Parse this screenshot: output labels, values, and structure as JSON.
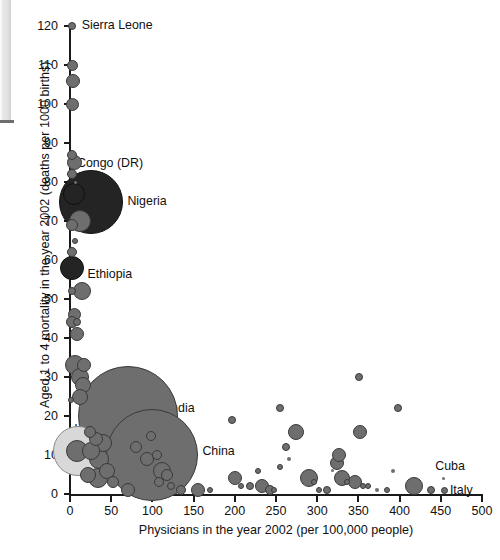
{
  "chart_data": {
    "type": "scatter",
    "title": "",
    "xlabel": "Physicians in the year 2002 (per 100,000 people)",
    "ylabel": "Aged 1 to 4 mortality in the year 2002 (deaths per 1000 births)",
    "xlim": [
      0,
      500
    ],
    "ylim": [
      0,
      120
    ],
    "xticks": [
      0,
      50,
      100,
      150,
      200,
      250,
      300,
      350,
      400,
      450,
      500
    ],
    "yticks": [
      0,
      10,
      20,
      30,
      40,
      50,
      60,
      70,
      80,
      90,
      100,
      110,
      120
    ],
    "grid": false,
    "legend": "none",
    "note": "Bubble area encodes country population; x = physicians per 100,000, y = under-5 (aged 1-4) mortality per 1000 births",
    "colors": {
      "bubble_fill": "#6e6e6e",
      "bubble_stroke": "#3a3a3a",
      "dark_bubble_fill": "#242424",
      "light_bubble_fill": "#d8d8d8",
      "axis": "#1a1a1a",
      "text": "#111111"
    },
    "annotations": [
      {
        "label": "Sierra Leone",
        "x": 2,
        "y": 120
      },
      {
        "label": "Congo (DR)",
        "x": 6,
        "y": 85
      },
      {
        "label": "Nigeria",
        "x": 26,
        "y": 75
      },
      {
        "label": "Ethiopia",
        "x": 3,
        "y": 58
      },
      {
        "label": "India",
        "x": 70,
        "y": 20
      },
      {
        "label": "Indonesia",
        "x": 10,
        "y": 11
      },
      {
        "label": "China",
        "x": 100,
        "y": 10
      },
      {
        "label": "Cuba",
        "x": 453,
        "y": 4
      },
      {
        "label": "Italy",
        "x": 455,
        "y": 1
      }
    ],
    "points": [
      {
        "x": 2,
        "y": 120,
        "r": 4,
        "t": "m"
      },
      {
        "x": 3,
        "y": 110,
        "r": 5.5,
        "t": "m"
      },
      {
        "x": 4,
        "y": 106,
        "r": 7,
        "t": "m"
      },
      {
        "x": 3,
        "y": 100,
        "r": 6.5,
        "t": "m"
      },
      {
        "x": 2,
        "y": 87,
        "r": 5,
        "t": "m"
      },
      {
        "x": 5,
        "y": 85,
        "r": 7.5,
        "t": "m"
      },
      {
        "x": 3,
        "y": 82,
        "r": 5,
        "t": "m"
      },
      {
        "x": 7,
        "y": 80,
        "r": 1.5,
        "t": "m"
      },
      {
        "x": 26,
        "y": 75,
        "r": 32,
        "t": "d"
      },
      {
        "x": 5,
        "y": 77,
        "r": 11,
        "t": "d"
      },
      {
        "x": 12,
        "y": 70,
        "r": 11,
        "t": "m"
      },
      {
        "x": 2,
        "y": 69,
        "r": 6,
        "t": "m"
      },
      {
        "x": 6,
        "y": 65,
        "r": 3,
        "t": "m"
      },
      {
        "x": 3,
        "y": 62,
        "r": 5,
        "t": "m"
      },
      {
        "x": 3,
        "y": 58,
        "r": 12,
        "t": "d"
      },
      {
        "x": 2,
        "y": 52,
        "r": 4,
        "t": "m"
      },
      {
        "x": 14,
        "y": 52,
        "r": 9,
        "t": "m"
      },
      {
        "x": 6,
        "y": 46,
        "r": 6.5,
        "t": "m"
      },
      {
        "x": 3,
        "y": 44,
        "r": 6,
        "t": "m"
      },
      {
        "x": 9,
        "y": 44,
        "r": 4,
        "t": "m"
      },
      {
        "x": 9,
        "y": 41,
        "r": 7,
        "t": "m"
      },
      {
        "x": 70,
        "y": 20,
        "r": 50,
        "t": "m"
      },
      {
        "x": 6,
        "y": 33,
        "r": 10,
        "t": "m"
      },
      {
        "x": 17,
        "y": 33,
        "r": 7,
        "t": "m"
      },
      {
        "x": 12,
        "y": 30,
        "r": 9,
        "t": "m"
      },
      {
        "x": 16,
        "y": 28,
        "r": 8,
        "t": "m"
      },
      {
        "x": 1,
        "y": 24,
        "r": 3,
        "t": "m"
      },
      {
        "x": 12,
        "y": 25,
        "r": 8,
        "t": "m"
      },
      {
        "x": 100,
        "y": 10,
        "r": 46,
        "t": "m"
      },
      {
        "x": 10,
        "y": 11,
        "r": 25,
        "t": "l"
      },
      {
        "x": 9,
        "y": 11,
        "r": 11,
        "t": "m"
      },
      {
        "x": 24,
        "y": 16,
        "r": 6,
        "t": "m"
      },
      {
        "x": 31,
        "y": 14,
        "r": 7,
        "t": "m"
      },
      {
        "x": 40,
        "y": 13,
        "r": 9,
        "t": "m"
      },
      {
        "x": 26,
        "y": 11,
        "r": 9,
        "t": "m"
      },
      {
        "x": 35,
        "y": 9,
        "r": 10,
        "t": "m"
      },
      {
        "x": 45,
        "y": 6,
        "r": 8,
        "t": "m"
      },
      {
        "x": 34,
        "y": 4,
        "r": 10,
        "t": "m"
      },
      {
        "x": 22,
        "y": 5,
        "r": 8,
        "t": "m"
      },
      {
        "x": 52,
        "y": 3,
        "r": 6,
        "t": "m"
      },
      {
        "x": 70,
        "y": 1,
        "r": 7,
        "t": "m"
      },
      {
        "x": 80,
        "y": 12,
        "r": 6,
        "t": "m"
      },
      {
        "x": 98,
        "y": 15,
        "r": 5,
        "t": "m"
      },
      {
        "x": 93,
        "y": 9,
        "r": 7,
        "t": "m"
      },
      {
        "x": 105,
        "y": 10,
        "r": 5,
        "t": "m"
      },
      {
        "x": 112,
        "y": 6,
        "r": 9,
        "t": "m"
      },
      {
        "x": 118,
        "y": 5,
        "r": 6,
        "t": "m"
      },
      {
        "x": 108,
        "y": 3,
        "r": 5,
        "t": "m"
      },
      {
        "x": 122,
        "y": 2,
        "r": 4,
        "t": "m"
      },
      {
        "x": 135,
        "y": 1,
        "r": 5,
        "t": "m"
      },
      {
        "x": 155,
        "y": 1,
        "r": 7,
        "t": "m"
      },
      {
        "x": 170,
        "y": 1,
        "r": 3,
        "t": "m"
      },
      {
        "x": 196,
        "y": 19,
        "r": 4,
        "t": "m"
      },
      {
        "x": 200,
        "y": 4,
        "r": 7,
        "t": "m"
      },
      {
        "x": 208,
        "y": 2,
        "r": 3,
        "t": "m"
      },
      {
        "x": 218,
        "y": 2,
        "r": 4,
        "t": "m"
      },
      {
        "x": 228,
        "y": 6,
        "r": 3,
        "t": "m"
      },
      {
        "x": 233,
        "y": 2,
        "r": 7,
        "t": "m"
      },
      {
        "x": 243,
        "y": 1,
        "r": 5,
        "t": "m"
      },
      {
        "x": 248,
        "y": 1,
        "r": 3,
        "t": "m"
      },
      {
        "x": 255,
        "y": 22,
        "r": 4,
        "t": "m"
      },
      {
        "x": 274,
        "y": 16,
        "r": 8,
        "t": "m"
      },
      {
        "x": 262,
        "y": 12,
        "r": 4,
        "t": "m"
      },
      {
        "x": 266,
        "y": 9,
        "r": 2,
        "t": "m"
      },
      {
        "x": 255,
        "y": 7,
        "r": 3,
        "t": "m"
      },
      {
        "x": 290,
        "y": 4,
        "r": 9,
        "t": "m"
      },
      {
        "x": 296,
        "y": 3,
        "r": 3,
        "t": "m"
      },
      {
        "x": 302,
        "y": 1,
        "r": 3,
        "t": "m"
      },
      {
        "x": 312,
        "y": 1,
        "r": 4,
        "t": "m"
      },
      {
        "x": 324,
        "y": 8,
        "r": 7,
        "t": "m"
      },
      {
        "x": 330,
        "y": 4,
        "r": 8,
        "t": "m"
      },
      {
        "x": 336,
        "y": 3,
        "r": 3,
        "t": "m"
      },
      {
        "x": 318,
        "y": 6,
        "r": 1.5,
        "t": "m"
      },
      {
        "x": 327,
        "y": 10,
        "r": 7,
        "t": "m"
      },
      {
        "x": 351,
        "y": 30,
        "r": 4,
        "t": "m"
      },
      {
        "x": 352,
        "y": 16,
        "r": 7,
        "t": "m"
      },
      {
        "x": 346,
        "y": 3,
        "r": 7,
        "t": "m"
      },
      {
        "x": 356,
        "y": 2,
        "r": 3,
        "t": "m"
      },
      {
        "x": 362,
        "y": 2,
        "r": 3,
        "t": "m"
      },
      {
        "x": 372,
        "y": 1,
        "r": 2,
        "t": "m"
      },
      {
        "x": 385,
        "y": 1,
        "r": 3,
        "t": "m"
      },
      {
        "x": 398,
        "y": 22,
        "r": 4,
        "t": "m"
      },
      {
        "x": 392,
        "y": 6,
        "r": 2,
        "t": "m"
      },
      {
        "x": 418,
        "y": 2,
        "r": 9,
        "t": "m"
      },
      {
        "x": 438,
        "y": 1,
        "r": 4,
        "t": "m"
      },
      {
        "x": 453,
        "y": 4,
        "r": 1.5,
        "t": "m"
      },
      {
        "x": 455,
        "y": 1,
        "r": 3.5,
        "t": "m"
      }
    ]
  }
}
